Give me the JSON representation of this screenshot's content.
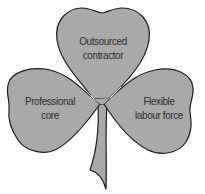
{
  "diagram": {
    "type": "shamrock",
    "colors": {
      "fill": "#a9a9a9",
      "outline": "#1e1e1e",
      "text": "#2e2e2e",
      "background": "#ffffff"
    },
    "leaves": [
      {
        "position": "top",
        "line1": "Outsourced",
        "line2": "contractor"
      },
      {
        "position": "left",
        "line1": "Professional",
        "line2": "core"
      },
      {
        "position": "right",
        "line1": "Flexible",
        "line2": "labour force"
      }
    ]
  }
}
